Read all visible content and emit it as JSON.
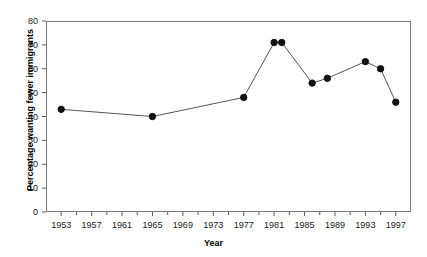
{
  "chart_data": {
    "type": "line",
    "title": "",
    "xlabel": "Year",
    "ylabel": "Percentage wanting fewer immigrants",
    "xlim": [
      1951,
      1999
    ],
    "ylim": [
      0,
      80
    ],
    "grid": false,
    "legend": null,
    "marker": "filled-circle",
    "line_color": "#555555",
    "marker_color": "#111111",
    "x_ticks": [
      1953,
      1957,
      1961,
      1965,
      1969,
      1973,
      1977,
      1981,
      1985,
      1989,
      1993,
      1997
    ],
    "x_tick_labels": [
      "1953",
      "1957",
      "1961",
      "1965",
      "1969",
      "1973",
      "1977",
      "1981",
      "1985",
      "1989",
      "1993",
      "1997"
    ],
    "y_ticks": [
      0,
      10,
      20,
      30,
      40,
      50,
      60,
      70,
      80
    ],
    "y_tick_labels": [
      "0",
      "10",
      "20",
      "30",
      "40",
      "50",
      "60",
      "70",
      "80"
    ],
    "x": [
      1953,
      1965,
      1977,
      1981,
      1982,
      1986,
      1988,
      1993,
      1995,
      1997
    ],
    "values": [
      43,
      40,
      48,
      71,
      71,
      54,
      56,
      63,
      60,
      46
    ],
    "points": [
      {
        "x": 1953,
        "y": 43
      },
      {
        "x": 1965,
        "y": 40
      },
      {
        "x": 1977,
        "y": 48
      },
      {
        "x": 1981,
        "y": 71
      },
      {
        "x": 1982,
        "y": 71
      },
      {
        "x": 1986,
        "y": 54
      },
      {
        "x": 1988,
        "y": 56
      },
      {
        "x": 1993,
        "y": 63
      },
      {
        "x": 1995,
        "y": 60
      },
      {
        "x": 1997,
        "y": 46
      }
    ]
  }
}
